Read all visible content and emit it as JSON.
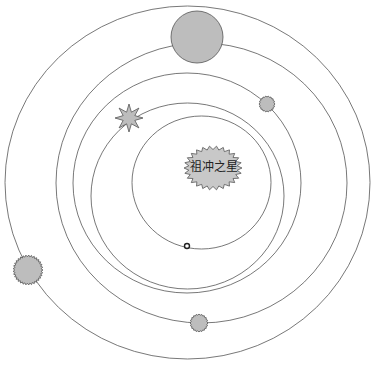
{
  "diagram": {
    "title": "",
    "sun": {
      "label": "祖冲之星",
      "shape": "spiky-ellipse",
      "cx": 213,
      "cy": 168,
      "rx": 29,
      "ry": 22,
      "fill": "#c8c8c8"
    },
    "orbits": [
      {
        "name": "orbit-1",
        "cx": 201.5,
        "cy": 182.5,
        "rx": 69.5,
        "ry": 66.5
      },
      {
        "name": "orbit-2",
        "cx": 187.5,
        "cy": 196,
        "rx": 96.5,
        "ry": 93
      },
      {
        "name": "orbit-3",
        "cx": 187,
        "cy": 183,
        "rx": 114,
        "ry": 110
      },
      {
        "name": "orbit-4",
        "cx": 201.5,
        "cy": 183,
        "rx": 145.5,
        "ry": 140
      },
      {
        "name": "orbit-5",
        "cx": 187.5,
        "cy": 182.5,
        "rx": 182.5,
        "ry": 176.5
      }
    ],
    "planets": [
      {
        "name": "tiny-ring-planet",
        "shape": "circle",
        "cx": 187,
        "cy": 246,
        "r": 2.5
      },
      {
        "name": "star-planet",
        "shape": "star-8",
        "cx": 129,
        "cy": 118,
        "r": 14
      },
      {
        "name": "small-spiky-planet",
        "shape": "spiky-circle",
        "cx": 267,
        "cy": 104,
        "r": 8
      },
      {
        "name": "large-planet",
        "shape": "circle",
        "cx": 197,
        "cy": 37,
        "r": 26
      },
      {
        "name": "bottom-spiky-planet",
        "shape": "spiky-circle",
        "cx": 199,
        "cy": 323,
        "r": 9
      },
      {
        "name": "left-spiky-planet",
        "shape": "spiky-circle",
        "cx": 28,
        "cy": 270,
        "r": 15
      }
    ],
    "colors": {
      "orbit_stroke": "#555555",
      "planet_fill": "#bdbdbd",
      "background": "#ffffff"
    }
  }
}
